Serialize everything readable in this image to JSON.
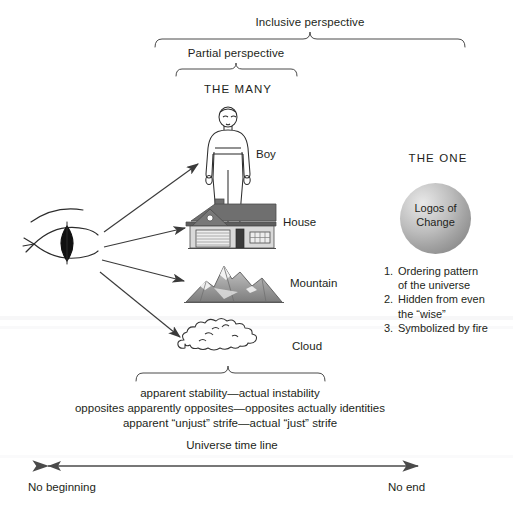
{
  "figure": {
    "title_partial_cut": "",
    "braces": {
      "inclusive_label": "Inclusive perspective",
      "partial_label": "Partial perspective"
    },
    "many": {
      "heading": "THE MANY",
      "items": [
        {
          "label": "Boy",
          "icon": "person-figure-icon"
        },
        {
          "label": "House",
          "icon": "house-icon"
        },
        {
          "label": "Mountain",
          "icon": "mountain-icon"
        },
        {
          "label": "Cloud",
          "icon": "cloud-icon"
        }
      ]
    },
    "observer": {
      "icon": "eye-icon",
      "arrow_count": 4
    },
    "one": {
      "heading": "THE ONE",
      "sphere_line1": "Logos of",
      "sphere_line2": "Change",
      "list": [
        {
          "num": "1.",
          "line1": "Ordering pattern",
          "line2": "of the universe"
        },
        {
          "num": "2.",
          "line1": "Hidden from even",
          "line2": "the “wise”"
        },
        {
          "num": "3.",
          "line1": "Symbolized by fire",
          "line2": ""
        }
      ]
    },
    "summary": {
      "line1": "apparent stability—actual instability",
      "line2": "opposites apparently opposites—opposites actually identities",
      "line3": "apparent “unjust” strife—actual “just” strife"
    },
    "timeline": {
      "label": "Universe time line",
      "left_end": "No beginning",
      "right_end": "No end"
    },
    "colors": {
      "ink": "#231f20",
      "line": "#4a4a4a",
      "sphere_light": "#e8e8e8",
      "sphere_dark": "#767676",
      "roof": "#6f6f6f",
      "wall": "#d9d9d9",
      "mountain": "#8a8a8a",
      "background": "#ffffff"
    }
  }
}
